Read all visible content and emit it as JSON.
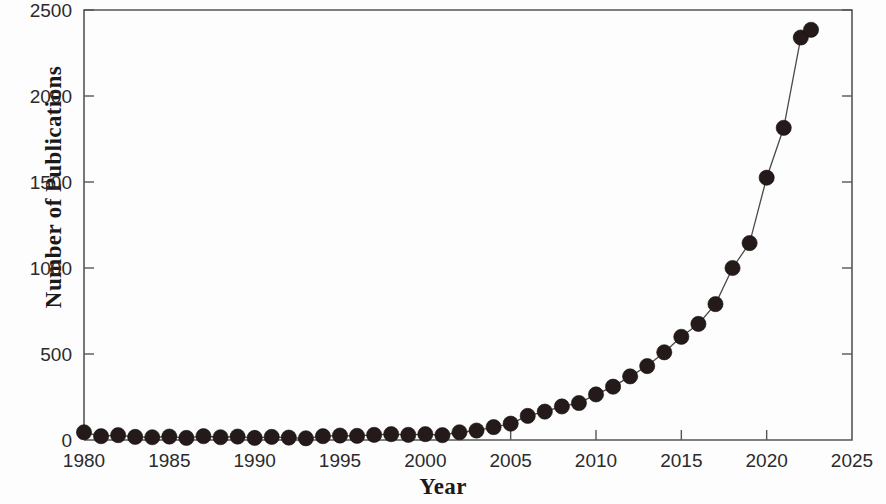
{
  "chart_data": {
    "type": "line",
    "title": "",
    "subtitle": "",
    "xlabel": "Year",
    "ylabel": "Number of Publications",
    "xlim": [
      1980,
      2025
    ],
    "ylim": [
      0,
      2500
    ],
    "xticks": [
      1980,
      1985,
      1990,
      1995,
      2000,
      2005,
      2010,
      2015,
      2020,
      2025
    ],
    "yticks": [
      0,
      500,
      1000,
      1500,
      2000,
      2500
    ],
    "grid": false,
    "legend": null,
    "marker": "filled-circle",
    "marker_color": "#231a19",
    "line_color": "#4a4a4a",
    "x": [
      1980,
      1981,
      1982,
      1983,
      1984,
      1985,
      1986,
      1987,
      1988,
      1989,
      1990,
      1991,
      1992,
      1993,
      1994,
      1995,
      1996,
      1997,
      1998,
      1999,
      2000,
      2001,
      2002,
      2003,
      2004,
      2005,
      2006,
      2007,
      2008,
      2009,
      2010,
      2011,
      2012,
      2013,
      2014,
      2015,
      2016,
      2017,
      2018,
      2019,
      2020,
      2021,
      2022
    ],
    "values": [
      45,
      22,
      28,
      18,
      16,
      20,
      12,
      22,
      16,
      20,
      12,
      18,
      14,
      10,
      22,
      26,
      24,
      30,
      34,
      30,
      34,
      28,
      45,
      55,
      75,
      95,
      140,
      165,
      195,
      215,
      265,
      310,
      370,
      430,
      510,
      600,
      675,
      790,
      1000,
      1145,
      1525,
      1815,
      2340
    ],
    "series": [
      {
        "name": "Number of Publications",
        "values": [
          45,
          22,
          28,
          18,
          16,
          20,
          12,
          22,
          16,
          20,
          12,
          18,
          14,
          10,
          22,
          26,
          24,
          30,
          34,
          30,
          34,
          28,
          45,
          55,
          75,
          95,
          140,
          165,
          195,
          215,
          265,
          310,
          370,
          430,
          510,
          600,
          675,
          790,
          1000,
          1145,
          1525,
          1815,
          2340
        ]
      }
    ],
    "extra_points": [
      {
        "x": 2022.6,
        "y": 2385
      }
    ]
  }
}
